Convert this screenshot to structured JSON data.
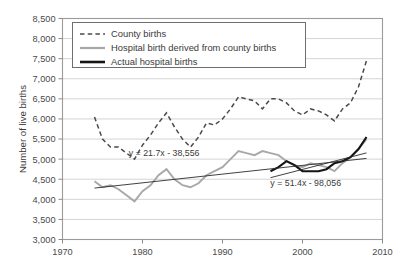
{
  "chart_data": {
    "type": "line",
    "title": "",
    "xlabel": "",
    "ylabel": "Number of live births",
    "xlim": [
      1970,
      2010
    ],
    "ylim": [
      3000,
      8500
    ],
    "xticks": [
      "1970",
      "1980",
      "1990",
      "2000",
      "2010"
    ],
    "xtick_values": [
      1970,
      1980,
      1990,
      2000,
      2010
    ],
    "yticks": [
      "3,000",
      "3,500",
      "4,000",
      "4,500",
      "5,000",
      "5,500",
      "6,000",
      "6,500",
      "7,000",
      "7,500",
      "8,000",
      "8,500"
    ],
    "ytick_values": [
      3000,
      3500,
      4000,
      4500,
      5000,
      5500,
      6000,
      6500,
      7000,
      7500,
      8000,
      8500
    ],
    "grid": true,
    "legend_position": "top-left",
    "series": [
      {
        "name": "County births",
        "style": "dashed",
        "color": "#4a4a4a",
        "x": [
          1974,
          1975,
          1976,
          1977,
          1978,
          1979,
          1980,
          1981,
          1982,
          1983,
          1984,
          1985,
          1986,
          1987,
          1988,
          1989,
          1990,
          1991,
          1992,
          1993,
          1994,
          1995,
          1996,
          1997,
          1998,
          1999,
          2000,
          2001,
          2002,
          2003,
          2004,
          2005,
          2006,
          2007,
          2008
        ],
        "values": [
          6050,
          5500,
          5300,
          5300,
          5150,
          5000,
          5350,
          5600,
          5900,
          6150,
          5800,
          5500,
          5300,
          5550,
          5900,
          5850,
          6000,
          6250,
          6550,
          6500,
          6450,
          6250,
          6500,
          6500,
          6400,
          6200,
          6100,
          6250,
          6200,
          6100,
          5950,
          6250,
          6400,
          6800,
          7450
        ]
      },
      {
        "name": "Hospital birth derived from county births",
        "style": "solid",
        "color": "#a8a8a8",
        "x": [
          1974,
          1975,
          1976,
          1977,
          1978,
          1979,
          1980,
          1981,
          1982,
          1983,
          1984,
          1985,
          1986,
          1987,
          1988,
          1989,
          1990,
          1991,
          1992,
          1993,
          1994,
          1995,
          1996,
          1997,
          1998,
          1999,
          2000,
          2001,
          2002,
          2003,
          2004,
          2005,
          2006,
          2007,
          2008
        ],
        "values": [
          4450,
          4300,
          4350,
          4250,
          4100,
          3950,
          4200,
          4350,
          4600,
          4750,
          4500,
          4350,
          4300,
          4400,
          4600,
          4700,
          4800,
          5000,
          5200,
          5150,
          5100,
          5200,
          5150,
          5100,
          4950,
          4850,
          4800,
          4900,
          4850,
          4800,
          4700,
          4900,
          5050,
          5250,
          5500
        ]
      },
      {
        "name": "Actual hospital births",
        "style": "solid",
        "color": "#141414",
        "x": [
          1996,
          1997,
          1998,
          1999,
          2000,
          2001,
          2002,
          2003,
          2004,
          2005,
          2006,
          2007,
          2008
        ],
        "values": [
          4700,
          4800,
          4950,
          4850,
          4700,
          4700,
          4700,
          4750,
          4900,
          4950,
          5050,
          5250,
          5550
        ]
      }
    ],
    "annotations": [
      {
        "text": "y = 21.7x - 38,556",
        "x": 1982.7,
        "y": 5080
      },
      {
        "text": "y = 51.4x - 98,056",
        "x": 2000.4,
        "y": 4330
      }
    ],
    "trendlines": [
      {
        "label": "y = 21.7x - 38,556",
        "slope": 21.7,
        "intercept": -38556,
        "x_start": 1974,
        "x_end": 2008
      },
      {
        "label": "y = 51.4x - 98,056",
        "slope": 51.4,
        "intercept": -98056,
        "x_start": 1996,
        "x_end": 2008
      }
    ]
  },
  "legend": {
    "items": [
      {
        "label": "County births",
        "swatch": "dashed-line-icon"
      },
      {
        "label": "Hospital birth derived from county births",
        "swatch": "gray-line-icon"
      },
      {
        "label": "Actual hospital births",
        "swatch": "black-line-icon"
      }
    ]
  }
}
